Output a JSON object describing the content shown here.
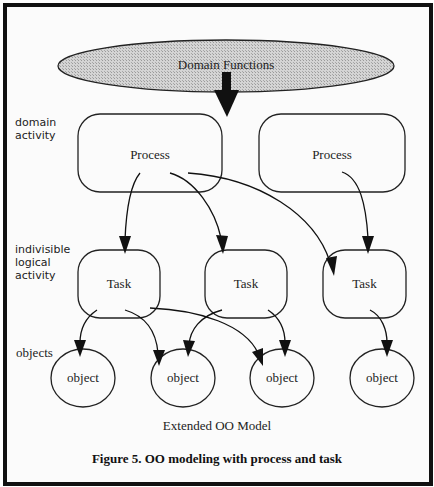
{
  "diagram": {
    "top_node": {
      "label": "Domain Functions",
      "shape": "ellipse",
      "fill": "#c8c8c8"
    },
    "row_labels": {
      "domain_activity": [
        "domain",
        "activity"
      ],
      "logical_activity": [
        "indivisible",
        "logical",
        "activity"
      ],
      "objects": "objects"
    },
    "processes": [
      {
        "label": "Process"
      },
      {
        "label": "Process"
      }
    ],
    "tasks": [
      {
        "label": "Task"
      },
      {
        "label": "Task"
      },
      {
        "label": "Task"
      }
    ],
    "objects": [
      {
        "label": "object"
      },
      {
        "label": "object"
      },
      {
        "label": "object"
      },
      {
        "label": "object"
      }
    ],
    "edges": [
      {
        "from": "Domain Functions",
        "to": "Process 1",
        "style": "bold"
      },
      {
        "from": "Process 1",
        "to": "Task 1"
      },
      {
        "from": "Process 1",
        "to": "Task 2"
      },
      {
        "from": "Process 1",
        "to": "Task 3"
      },
      {
        "from": "Process 2",
        "to": "Task 3"
      },
      {
        "from": "Task 1",
        "to": "object 1"
      },
      {
        "from": "Task 1",
        "to": "object 2"
      },
      {
        "from": "Task 1",
        "to": "object 3"
      },
      {
        "from": "Task 2",
        "to": "object 2"
      },
      {
        "from": "Task 2",
        "to": "object 3"
      },
      {
        "from": "Task 3",
        "to": "object 4"
      }
    ],
    "model_title": "Extended OO Model",
    "caption": "Figure 5. OO modeling with process and task"
  }
}
